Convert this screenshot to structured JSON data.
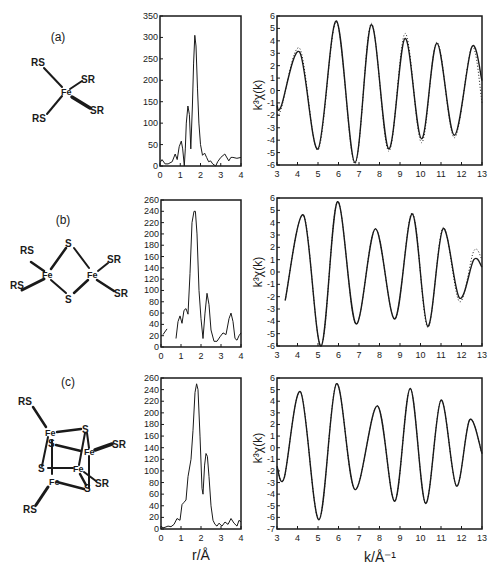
{
  "figure": {
    "panels": [
      {
        "id": "a",
        "label": "(a)",
        "structure": "Fe(SR)4 tetrahedral monomer"
      },
      {
        "id": "b",
        "label": "(b)",
        "structure": "Fe2S2(SR)4 dimer"
      },
      {
        "id": "c",
        "label": "(c)",
        "structure": "Fe4S4(SR)4 cubane"
      }
    ],
    "molecules": {
      "a": {
        "atoms": [
          "RS",
          "SR",
          "Fe",
          "RS",
          "SR"
        ]
      },
      "b": {
        "atoms": [
          "S",
          "RS",
          "Fe",
          "Fe",
          "SR",
          "RS",
          "S",
          "SR"
        ]
      },
      "c": {
        "atoms": [
          "RS",
          "Fe",
          "S",
          "S",
          "Fe",
          "SR",
          "S",
          "Fe",
          "Fe",
          "SR",
          "S",
          "RS"
        ]
      }
    },
    "axis_labels": {
      "ft_x": "r/Å",
      "exafs_x": "k/Å⁻¹",
      "exafs_y": "k³χ(k)"
    }
  },
  "chart_data": [
    {
      "id": "a-ft",
      "type": "line",
      "panel": "(a)",
      "title": "",
      "xlabel": "",
      "ylabel": "",
      "xlim": [
        0,
        4
      ],
      "ylim": [
        0,
        350
      ],
      "xticks": [
        0,
        1,
        2,
        3,
        4
      ],
      "yticks": [
        0,
        50,
        100,
        150,
        200,
        250,
        300,
        350
      ],
      "grid": false,
      "series": [
        {
          "name": "Fourier transform",
          "style": "solid",
          "x": [
            0,
            0.1,
            0.25,
            0.4,
            0.6,
            0.75,
            0.85,
            0.95,
            1.05,
            1.12,
            1.2,
            1.25,
            1.3,
            1.38,
            1.45,
            1.52,
            1.6,
            1.66,
            1.72,
            1.78,
            1.85,
            1.92,
            2.0,
            2.1,
            2.2,
            2.3,
            2.4,
            2.5,
            2.6,
            2.75,
            2.85,
            3.0,
            3.2,
            3.4,
            3.5,
            3.6,
            3.8,
            4.0
          ],
          "y": [
            8,
            15,
            5,
            5,
            10,
            28,
            15,
            45,
            58,
            40,
            0,
            40,
            100,
            140,
            120,
            40,
            140,
            240,
            305,
            280,
            180,
            100,
            50,
            25,
            30,
            20,
            10,
            12,
            5,
            0,
            10,
            20,
            28,
            12,
            20,
            20,
            18,
            20
          ]
        }
      ]
    },
    {
      "id": "a-exafs",
      "type": "line",
      "panel": "(a)",
      "title": "",
      "xlabel": "",
      "ylabel": "k³χ(k)",
      "xlim": [
        3,
        13
      ],
      "ylim": [
        -6,
        6
      ],
      "xticks": [
        3,
        4,
        5,
        6,
        7,
        8,
        9,
        10,
        11,
        12,
        13
      ],
      "yticks": [
        -6,
        -5,
        -4,
        -3,
        -2,
        -1,
        0,
        1,
        2,
        3,
        4,
        5,
        6
      ],
      "grid": false,
      "series": [
        {
          "name": "experiment",
          "style": "solid",
          "x": [
            3.0,
            3.2,
            4.1,
            5.0,
            5.9,
            6.8,
            7.6,
            8.45,
            9.25,
            10.05,
            10.8,
            11.65,
            12.5,
            13.0
          ],
          "y": [
            -1.2,
            -1.3,
            3.1,
            -4.7,
            5.6,
            -5.8,
            5.3,
            -4.7,
            4.2,
            -3.9,
            3.8,
            -3.6,
            3.5,
            0.8
          ]
        },
        {
          "name": "fit",
          "style": "dotted",
          "x": [
            3.0,
            3.2,
            4.1,
            5.0,
            5.9,
            6.8,
            7.6,
            8.45,
            9.25,
            10.05,
            10.8,
            11.65,
            12.5,
            13.0
          ],
          "y": [
            -1.9,
            -1.5,
            3.4,
            -4.8,
            5.5,
            -5.9,
            5.4,
            -4.9,
            4.6,
            -4.2,
            3.9,
            -3.8,
            3.5,
            -1.0
          ]
        }
      ]
    },
    {
      "id": "b-ft",
      "type": "line",
      "panel": "(b)",
      "title": "",
      "xlabel": "",
      "ylabel": "",
      "xlim": [
        0,
        4
      ],
      "ylim": [
        0,
        260
      ],
      "xticks": [
        0,
        1,
        2,
        3,
        4
      ],
      "yticks": [
        0,
        20,
        40,
        60,
        80,
        100,
        120,
        140,
        160,
        180,
        200,
        220,
        240,
        260
      ],
      "grid": false,
      "series": [
        {
          "name": "Fourier transform (fragment)",
          "style": "solid",
          "x": [
            0.1,
            0.3
          ],
          "y": [
            22,
            32
          ]
        },
        {
          "name": "Fourier transform",
          "style": "solid",
          "x": [
            0.75,
            0.85,
            0.95,
            1.05,
            1.15,
            1.25,
            1.35,
            1.45,
            1.55,
            1.65,
            1.72,
            1.8,
            1.9,
            2.0,
            2.1,
            2.2,
            2.3,
            2.4,
            2.5,
            2.65,
            2.8,
            2.95,
            3.1,
            3.25,
            3.4,
            3.5,
            3.6,
            3.7,
            3.8,
            3.9,
            4.0
          ],
          "y": [
            15,
            45,
            55,
            42,
            65,
            68,
            58,
            130,
            220,
            240,
            240,
            200,
            100,
            50,
            15,
            60,
            95,
            75,
            30,
            10,
            10,
            18,
            25,
            22,
            50,
            60,
            45,
            15,
            12,
            20,
            25
          ]
        }
      ]
    },
    {
      "id": "b-exafs",
      "type": "line",
      "panel": "(b)",
      "title": "",
      "xlabel": "",
      "ylabel": "k³χ(k)",
      "xlim": [
        3,
        13
      ],
      "ylim": [
        -6,
        6
      ],
      "xticks": [
        3,
        4,
        5,
        6,
        7,
        8,
        9,
        10,
        11,
        12,
        13
      ],
      "yticks": [
        -6,
        -5,
        -4,
        -3,
        -2,
        -1,
        0,
        1,
        2,
        3,
        4,
        5,
        6
      ],
      "grid": false,
      "series": [
        {
          "name": "experiment",
          "style": "solid",
          "x": [
            3.4,
            4.3,
            5.15,
            5.95,
            6.85,
            7.8,
            8.75,
            9.6,
            10.35,
            11.1,
            11.9,
            12.6,
            13.0
          ],
          "y": [
            -2.3,
            4.6,
            -6.0,
            5.7,
            -4.2,
            3.5,
            -3.8,
            4.7,
            -4.4,
            3.5,
            -2.1,
            1.0,
            0.4
          ]
        },
        {
          "name": "fit",
          "style": "dotted",
          "x": [
            3.4,
            4.3,
            5.15,
            5.95,
            6.85,
            7.8,
            8.75,
            9.6,
            10.35,
            11.1,
            11.9,
            12.6,
            13.0
          ],
          "y": [
            -2.3,
            4.6,
            -6.0,
            5.7,
            -4.2,
            3.5,
            -3.8,
            4.8,
            -4.5,
            3.6,
            -2.4,
            1.7,
            1.0
          ]
        }
      ]
    },
    {
      "id": "c-ft",
      "type": "line",
      "panel": "(c)",
      "title": "",
      "xlabel": "r/Å",
      "ylabel": "",
      "xlim": [
        0,
        4
      ],
      "ylim": [
        0,
        260
      ],
      "xticks": [
        0,
        1,
        2,
        3,
        4
      ],
      "yticks": [
        0,
        20,
        40,
        60,
        80,
        100,
        120,
        140,
        160,
        180,
        200,
        220,
        240,
        260
      ],
      "grid": false,
      "series": [
        {
          "name": "Fourier transform",
          "style": "solid",
          "x": [
            0,
            0.1,
            0.2,
            0.35,
            0.5,
            0.65,
            0.8,
            0.95,
            1.05,
            1.15,
            1.25,
            1.35,
            1.5,
            1.6,
            1.7,
            1.78,
            1.85,
            1.95,
            2.05,
            2.1,
            2.18,
            2.25,
            2.32,
            2.4,
            2.5,
            2.6,
            2.7,
            2.8,
            2.9,
            3.05,
            3.2,
            3.35,
            3.5,
            3.65,
            3.8,
            3.9,
            4.0
          ],
          "y": [
            5,
            2,
            3,
            5,
            4,
            8,
            18,
            15,
            42,
            46,
            50,
            90,
            120,
            170,
            235,
            250,
            240,
            160,
            70,
            60,
            110,
            130,
            125,
            90,
            40,
            15,
            8,
            5,
            10,
            5,
            12,
            8,
            18,
            10,
            5,
            15,
            12
          ]
        }
      ]
    },
    {
      "id": "c-exafs",
      "type": "line",
      "panel": "(c)",
      "title": "",
      "xlabel": "k/Å⁻¹",
      "ylabel": "k³χ(k)",
      "xlim": [
        3,
        13
      ],
      "ylim": [
        -7,
        6
      ],
      "xticks": [
        3,
        4,
        5,
        6,
        7,
        8,
        9,
        10,
        11,
        12,
        13
      ],
      "yticks": [
        -7,
        -6,
        -5,
        -4,
        -3,
        -2,
        -1,
        0,
        1,
        2,
        3,
        4,
        5,
        6
      ],
      "grid": false,
      "series": [
        {
          "name": "experiment",
          "style": "solid",
          "x": [
            3.0,
            3.35,
            4.15,
            5.05,
            5.9,
            6.8,
            7.9,
            8.75,
            9.5,
            10.25,
            11.0,
            11.75,
            12.4,
            13.0
          ],
          "y": [
            -1.6,
            -2.6,
            4.8,
            -6.2,
            5.5,
            -3.6,
            3.6,
            -4.6,
            5.1,
            -4.8,
            4.1,
            -3.3,
            2.4,
            -0.5
          ]
        },
        {
          "name": "fit",
          "style": "dotted",
          "x": [
            3.0,
            3.35,
            4.15,
            5.05,
            5.9,
            6.8,
            7.9,
            8.75,
            9.5,
            10.25,
            11.0,
            11.75,
            12.4,
            13.0
          ],
          "y": [
            -1.6,
            -2.6,
            4.8,
            -6.2,
            5.5,
            -3.6,
            3.6,
            -4.6,
            5.1,
            -4.8,
            4.1,
            -3.3,
            2.4,
            -0.5
          ]
        }
      ]
    }
  ]
}
